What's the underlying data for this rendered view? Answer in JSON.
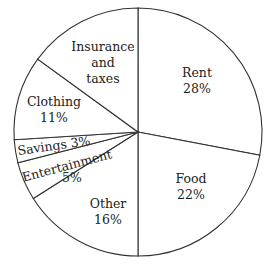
{
  "chart_data": {
    "type": "pie",
    "title": "",
    "categories": [
      "Rent",
      "Food",
      "Other",
      "Entertainment",
      "Savings",
      "Clothing",
      "Insurance and taxes"
    ],
    "values": [
      28,
      22,
      16,
      5,
      3,
      11,
      15
    ],
    "labels": [
      {
        "name": "Rent",
        "value_text": "28%"
      },
      {
        "name": "Food",
        "value_text": "22%"
      },
      {
        "name": "Other",
        "value_text": "16%"
      },
      {
        "name": "Entertainment",
        "value_text": "5%"
      },
      {
        "name": "Savings",
        "value_text": "3%"
      },
      {
        "name": "Clothing",
        "value_text": "11%"
      },
      {
        "name": "Insurance and taxes",
        "value_text": ""
      }
    ],
    "legend": "none (labels inside slices)",
    "colors": {
      "fill": "#ffffff",
      "stroke": "#333333",
      "text": "#222222"
    }
  },
  "labels": {
    "rent_name": "Rent",
    "rent_pct": "28%",
    "food_name": "Food",
    "food_pct": "22%",
    "other_name": "Other",
    "other_pct": "16%",
    "ent_name": "Entertainment",
    "ent_pct": "5%",
    "savings": "Savings 3%",
    "clothing_name": "Clothing",
    "clothing_pct": "11%",
    "ins_line1": "Insurance",
    "ins_line2": "and",
    "ins_line3": "taxes"
  }
}
